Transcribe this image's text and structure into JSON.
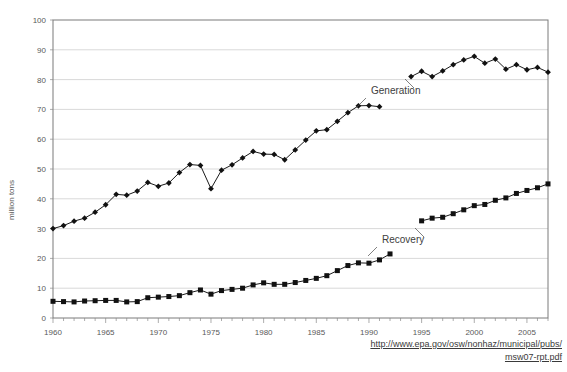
{
  "chart_data": {
    "type": "line",
    "title": "",
    "xlabel": "",
    "ylabel": "million tons",
    "xlim": [
      1960,
      2007
    ],
    "ylim": [
      0,
      100
    ],
    "ytick_step": 10,
    "xtick_step": 5,
    "grid": true,
    "legend_position": "inline-annotations",
    "y_ticks": [
      "0",
      "10",
      "20",
      "30",
      "40",
      "50",
      "60",
      "70",
      "80",
      "90",
      "100"
    ],
    "x_ticks": [
      "1960",
      "1965",
      "1970",
      "1975",
      "1980",
      "1985",
      "1990",
      "1995",
      "2000",
      "2005"
    ],
    "x": [
      1960,
      1961,
      1962,
      1963,
      1964,
      1965,
      1966,
      1967,
      1968,
      1969,
      1970,
      1971,
      1972,
      1973,
      1974,
      1975,
      1976,
      1977,
      1978,
      1979,
      1980,
      1981,
      1982,
      1983,
      1984,
      1985,
      1986,
      1987,
      1988,
      1989,
      1990,
      1991,
      1992,
      1993,
      1994,
      1995,
      1996,
      1997,
      1998,
      1999,
      2000,
      2001,
      2002,
      2003,
      2004,
      2005,
      2006,
      2007
    ],
    "series": [
      {
        "name": "Generation",
        "marker": "diamond",
        "color": "#111111",
        "values": [
          30.0,
          31.0,
          32.5,
          33.5,
          35.5,
          38.0,
          41.5,
          41.2,
          42.6,
          45.5,
          44.2,
          45.3,
          48.8,
          51.5,
          51.2,
          43.4,
          49.6,
          51.4,
          53.7,
          55.9,
          55.0,
          54.9,
          53.1,
          56.4,
          59.7,
          62.8,
          63.2,
          66.0,
          68.9,
          71.2,
          71.3,
          70.9,
          null,
          null,
          81.0,
          82.8,
          81.0,
          82.9,
          85.0,
          86.6,
          87.8,
          85.5,
          86.9,
          83.5,
          85.0,
          83.3,
          84.1,
          82.5
        ]
      },
      {
        "name": "Recovery",
        "marker": "square",
        "color": "#111111",
        "values": [
          5.6,
          5.5,
          5.4,
          5.7,
          5.8,
          5.9,
          5.9,
          5.4,
          5.5,
          6.8,
          7.0,
          7.2,
          7.5,
          8.5,
          9.4,
          8.0,
          9.2,
          9.6,
          10.0,
          11.1,
          11.8,
          11.3,
          11.3,
          11.9,
          12.6,
          13.3,
          14.2,
          15.9,
          17.6,
          18.5,
          18.4,
          19.5,
          21.5,
          null,
          null,
          32.6,
          33.5,
          33.8,
          35.0,
          36.3,
          37.7,
          38.1,
          39.5,
          40.3,
          41.8,
          42.8,
          43.7,
          45.0
        ]
      }
    ],
    "annotations": [
      {
        "name": "Generation",
        "text": "Generation",
        "x_px": 371,
        "y_px": 94
      },
      {
        "name": "Recovery",
        "text": "Recovery",
        "x_px": 382,
        "y_px": 243
      }
    ]
  },
  "footer": {
    "url_line1": "http://www.epa.gov/osw/nonhaz/municipal/pubs/",
    "url_line2": "msw07-rpt.pdf"
  }
}
